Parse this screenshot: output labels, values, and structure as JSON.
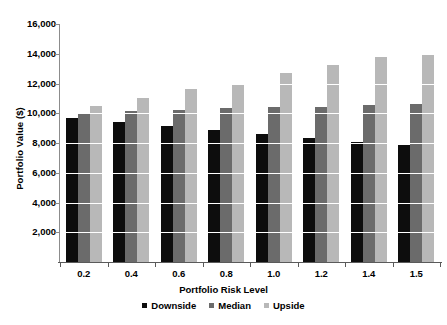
{
  "chart_data": {
    "type": "bar",
    "title": "",
    "xlabel": "Portfolio Risk Level",
    "ylabel": "Portfolio Value ($)",
    "categories": [
      "0.2",
      "0.4",
      "0.6",
      "0.8",
      "1.0",
      "1.2",
      "1.4",
      "1.5"
    ],
    "series": [
      {
        "name": "Downside",
        "color": "#0d0d0d",
        "values": [
          9700,
          9400,
          9150,
          8900,
          8600,
          8350,
          8050,
          7900
        ]
      },
      {
        "name": "Median",
        "color": "#6b6b6b",
        "values": [
          10000,
          10150,
          10250,
          10350,
          10400,
          10450,
          10550,
          10600
        ]
      },
      {
        "name": "Upside",
        "color": "#b8b8b8",
        "values": [
          10500,
          11000,
          11600,
          12000,
          12700,
          13250,
          13750,
          14000
        ]
      }
    ],
    "ylim": [
      0,
      16000
    ],
    "y_ticks": [
      2000,
      4000,
      6000,
      8000,
      10000,
      12000,
      14000,
      16000
    ],
    "y_tick_labels": [
      "2,000",
      "4,000",
      "6,000",
      "8,000",
      "10,000",
      "12,000",
      "14,000",
      "16,000"
    ],
    "grid": true,
    "grid_color": "#ffffff",
    "legend_position": "bottom",
    "legend": [
      "Downside",
      "Median",
      "Upside"
    ],
    "background": "#ffffff"
  }
}
